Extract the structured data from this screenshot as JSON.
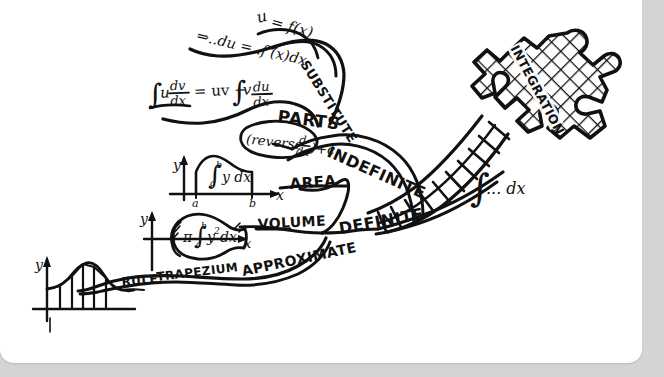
{
  "document": {
    "kind": "hand-drawn-mind-map",
    "subject": "Integration",
    "background_color": "#d4d4d4",
    "card_color": "#ffffff",
    "ink_color": "#111111"
  },
  "root": {
    "label": "INTEGRATION",
    "shape": "jigsaw-puzzle-piece",
    "notation": "∫ ... dx"
  },
  "branches": [
    {
      "id": "indefinite",
      "label": "INDEFINITE",
      "note": "(reverse d/dx) + c",
      "children": [
        {
          "id": "substitute",
          "label": "SUBSTITUTE",
          "formulas": [
            "u = f(x)",
            "⇒ ..du = ..f'(x)dx"
          ]
        },
        {
          "id": "parts",
          "label": "PARTS",
          "formulas": [
            "∫u dv/dx = uv − ∫v du/dx"
          ]
        }
      ]
    },
    {
      "id": "definite",
      "label": "DEFINITE",
      "children": [
        {
          "id": "area",
          "label": "AREA",
          "formulas": [
            "∫ₐᵇ y dx"
          ],
          "sketch": "area-under-curve-axes"
        },
        {
          "id": "volume",
          "label": "VOLUME",
          "formulas": [
            "π∫ₐᵇ y² dx"
          ],
          "sketch": "solid-of-revolution"
        },
        {
          "id": "approximate",
          "label": "APPROXIMATE",
          "children": [
            {
              "id": "trapezium-rule",
              "label_a": "TRAPEZIUM",
              "label_b": "RULE",
              "sketch": "trapezium-strips-under-bell-curve"
            }
          ]
        }
      ]
    }
  ],
  "labels": {
    "integration": "INTEGRATION",
    "indefinite": "INDEFINITE",
    "definite": "DEFINITE",
    "substitute": "SUBSTITUTE",
    "parts": "PARTS",
    "area": "AREA",
    "volume": "VOLUME",
    "approximate": "APPROXIMATE",
    "trapezium": "TRAPEZIUM",
    "rule": "RULE"
  },
  "formulas": {
    "root_notation_int": "∫",
    "root_notation_rest": "... dx",
    "sub_u": "u",
    "sub_eq": "= f(x)",
    "sub_line": "⇒..du =..f'(x)dx",
    "parts_int1": "∫",
    "parts_u": "u",
    "parts_dv": "dv",
    "parts_dx1": "dx",
    "parts_mid": "= uv −",
    "parts_int2": "∫",
    "parts_v": "v",
    "parts_du": "du",
    "parts_dx2": "dx",
    "indef_note_open": "(reverse",
    "indef_note_d": "d",
    "indef_note_dx": "dx",
    "indef_note_close": ")+c",
    "area_int": "∫",
    "area_upper": "b",
    "area_lower": "a",
    "area_body": "y dx",
    "area_axis_y": "y",
    "area_axis_x": "x",
    "area_tick_a": "a",
    "area_tick_b": "b",
    "vol_pi": "π",
    "vol_int": "∫",
    "vol_upper": "b",
    "vol_lower": "a",
    "vol_body": "y",
    "vol_sq": "2",
    "vol_dx": "dx",
    "vol_axis_y": "y",
    "vol_axis_x": "x",
    "trap_axis_y": "y"
  }
}
